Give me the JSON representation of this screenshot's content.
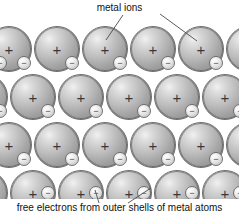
{
  "figure": {
    "type": "metallic-bonding-lattice-diagram",
    "background_color": "#ffffff",
    "width": 239,
    "height": 212
  },
  "labels": {
    "top": {
      "text": "metal ions",
      "leader_lines": [
        {
          "from_x": 123,
          "from_y": 15,
          "to_x": 106,
          "to_y": 40
        },
        {
          "from_x": 160,
          "from_y": 14,
          "to_x": 197,
          "to_y": 41
        }
      ]
    },
    "bottom": {
      "text": "free electrons from outer shells of metal atoms",
      "leader_lines": [
        {
          "from_x": 99,
          "from_y": 203,
          "to_x": 95,
          "to_y": 190
        },
        {
          "from_x": 128,
          "from_y": 203,
          "to_x": 151,
          "to_y": 188
        }
      ]
    }
  },
  "legend": {
    "ion_symbol": "+",
    "ion_meaning": "metal ion",
    "electron_symbol": "−",
    "electron_meaning": "free electron"
  },
  "colors": {
    "ion_highlight": "#f2f2f2",
    "ion_mid": "#bbbbbb",
    "ion_shadow": "#8a8a8a",
    "ion_outline": "#6d6d6d",
    "electron_fill": "#f0f0f0",
    "electron_outline": "#6f6f6f",
    "text": "#111111",
    "leader_line": "#4a4a4a"
  },
  "lattice": {
    "ion_diameter": 46,
    "electron_diameter": 14,
    "rows": [
      {
        "y": 26,
        "offset": -14,
        "count": 6
      },
      {
        "y": 74,
        "offset": 10,
        "count": 6
      },
      {
        "y": 122,
        "offset": -14,
        "count": 6
      },
      {
        "y": 170,
        "offset": 10,
        "count": 6
      }
    ],
    "column_spacing": 48,
    "ions": [
      {
        "x": -14,
        "y": 26
      },
      {
        "x": 34,
        "y": 26
      },
      {
        "x": 82,
        "y": 26
      },
      {
        "x": 130,
        "y": 26
      },
      {
        "x": 178,
        "y": 26
      },
      {
        "x": 226,
        "y": 26
      },
      {
        "x": 10,
        "y": 74
      },
      {
        "x": 58,
        "y": 74
      },
      {
        "x": 106,
        "y": 74
      },
      {
        "x": 154,
        "y": 74
      },
      {
        "x": 202,
        "y": 74
      },
      {
        "x": -38,
        "y": 74
      },
      {
        "x": -14,
        "y": 122
      },
      {
        "x": 34,
        "y": 122
      },
      {
        "x": 82,
        "y": 122
      },
      {
        "x": 130,
        "y": 122
      },
      {
        "x": 178,
        "y": 122
      },
      {
        "x": 226,
        "y": 122
      },
      {
        "x": 10,
        "y": 170
      },
      {
        "x": 58,
        "y": 170
      },
      {
        "x": 106,
        "y": 170
      },
      {
        "x": 154,
        "y": 170
      },
      {
        "x": 202,
        "y": 170
      },
      {
        "x": -38,
        "y": 170
      }
    ],
    "electrons": [
      {
        "x": 17,
        "y": 56
      },
      {
        "x": 65,
        "y": 56
      },
      {
        "x": 113,
        "y": 56
      },
      {
        "x": 161,
        "y": 56
      },
      {
        "x": 209,
        "y": 56
      },
      {
        "x": -7,
        "y": 56
      },
      {
        "x": 41,
        "y": 104
      },
      {
        "x": 89,
        "y": 104
      },
      {
        "x": 137,
        "y": 104
      },
      {
        "x": 185,
        "y": 104
      },
      {
        "x": 233,
        "y": 104
      },
      {
        "x": -7,
        "y": 104
      },
      {
        "x": 17,
        "y": 152
      },
      {
        "x": 65,
        "y": 152
      },
      {
        "x": 113,
        "y": 152
      },
      {
        "x": 161,
        "y": 152
      },
      {
        "x": 209,
        "y": 152
      },
      {
        "x": 41,
        "y": 186
      },
      {
        "x": 89,
        "y": 186
      },
      {
        "x": 137,
        "y": 186
      },
      {
        "x": 185,
        "y": 186
      },
      {
        "x": 233,
        "y": 186
      }
    ]
  }
}
